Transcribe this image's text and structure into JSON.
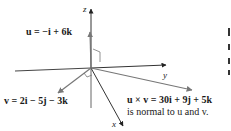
{
  "axes": {
    "x_label": "x",
    "y_label": "y",
    "z_label": "z"
  },
  "vectors": {
    "u": {
      "label": "u = −i + 6k",
      "equation": "−i + 6k",
      "color": "#555555"
    },
    "v": {
      "label": "v = 2i − 5j − 3k",
      "equation": "2i − 5j − 3k",
      "color": "#555555"
    },
    "uxv": {
      "label": "u × v = 30i + 9j + 5k",
      "equation": "30i + 9j + 5k",
      "color": "#555555"
    }
  },
  "annotation": "is normal to u and v.",
  "colors": {
    "axis": "#333333",
    "vector": "#666666",
    "text": "#1a1a1a"
  }
}
